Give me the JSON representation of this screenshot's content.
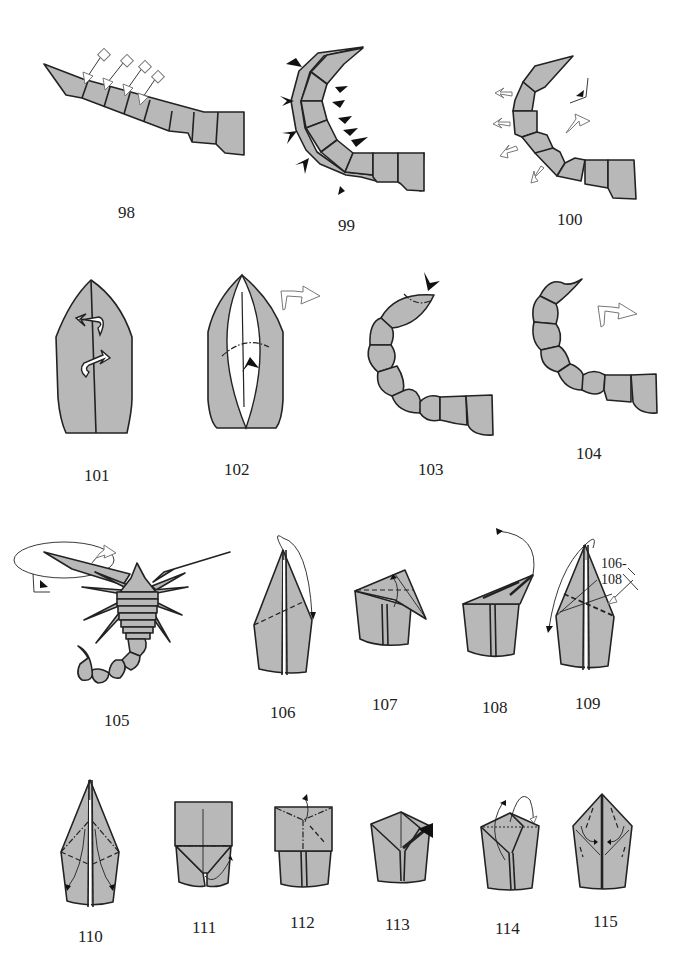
{
  "page": {
    "type": "origami-instructions",
    "paper_color": "#b8b8b8",
    "line_color": "#222222",
    "background": "#ffffff"
  },
  "steps": [
    {
      "number": "98",
      "description": "tail segments with four repeat-arrow marks"
    },
    {
      "number": "99",
      "description": "tail curved, pleat/crimp arrows along both edges"
    },
    {
      "number": "100",
      "description": "tail curved, outward shaping arrows, view-direction symbol"
    },
    {
      "number": "101",
      "description": "rounded piece with two turn-over arrows on center line"
    },
    {
      "number": "102",
      "description": "open lens shape, valley-mountain line and push arrow"
    },
    {
      "number": "103",
      "description": "curved tail, tip with push arrow"
    },
    {
      "number": "104",
      "description": "curved tail with stinger, turn-over arrow"
    },
    {
      "number": "105",
      "description": "completed scorpion, circle highlight on claw"
    },
    {
      "number": "106",
      "description": "kite shape, fold tip down along dashed line"
    },
    {
      "number": "107",
      "description": "tip folded over, fold back up"
    },
    {
      "number": "108",
      "description": "unfold upward arrow"
    },
    {
      "number": "109",
      "description": "repeat marker",
      "repeat_label": "106-108"
    },
    {
      "number": "110",
      "description": "kite with mountain/valley creases, swing arrows"
    },
    {
      "number": "111",
      "description": "square top with mountain fold line"
    },
    {
      "number": "112",
      "description": "square with crease lines, unfold arrow"
    },
    {
      "number": "113",
      "description": "house shape with sink/push arrow"
    },
    {
      "number": "114",
      "description": "house shape with wrap arrow"
    },
    {
      "number": "115",
      "description": "pointed shape with inside reverse fold arrows"
    }
  ]
}
